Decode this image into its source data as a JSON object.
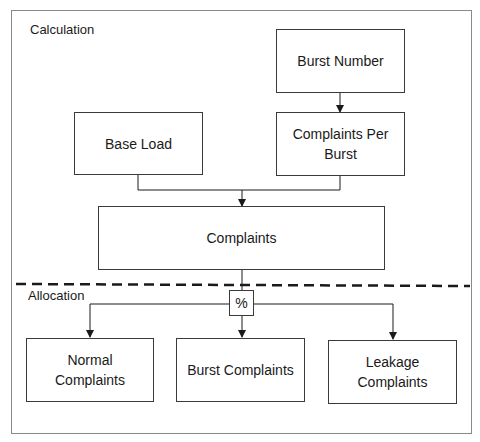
{
  "diagram": {
    "sections": {
      "top_label": "Calculation",
      "bottom_label": "Allocation"
    },
    "nodes": {
      "burst_number": "Burst Number",
      "complaints_per_burst": "Complaints Per Burst",
      "base_load": "Base Load",
      "complaints": "Complaints",
      "percent_operator": "%",
      "normal_complaints": "Normal Complaints",
      "burst_complaints": "Burst Complaints",
      "leakage_complaints": "Leakage Complaints"
    },
    "edges": [
      {
        "from": "Burst Number",
        "to": "Complaints Per Burst"
      },
      {
        "from": "Base Load",
        "to": "Complaints"
      },
      {
        "from": "Complaints Per Burst",
        "to": "Complaints"
      },
      {
        "from": "Complaints",
        "to": "%"
      },
      {
        "from": "%",
        "to": "Normal Complaints"
      },
      {
        "from": "%",
        "to": "Burst Complaints"
      },
      {
        "from": "%",
        "to": "Leakage Complaints"
      }
    ],
    "colors": {
      "line": "#1a1a1a",
      "frame": "#8a8a8a",
      "background": "#ffffff"
    }
  }
}
